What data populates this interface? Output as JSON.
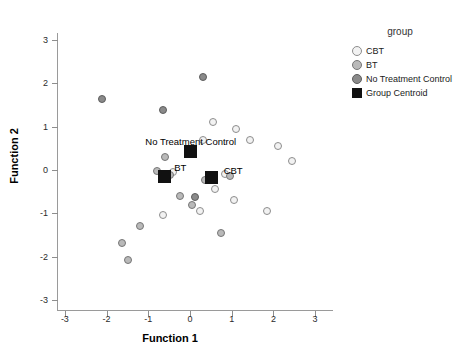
{
  "chart_data": {
    "type": "scatter",
    "title": "",
    "xlabel": "Function 1",
    "ylabel": "Function 2",
    "xlim": [
      -3.4,
      3.4
    ],
    "ylim": [
      -3.4,
      3.4
    ],
    "xticks": [
      "-3",
      "-2",
      "-1",
      "0",
      "1",
      "2",
      "3"
    ],
    "xtickvals": [
      -3,
      -2,
      -1,
      0,
      1,
      2,
      3
    ],
    "yticks": [
      "3",
      "2",
      "1",
      "0",
      "-1",
      "-2",
      "-3"
    ],
    "ytickvals": [
      3,
      2,
      1,
      0,
      -1,
      -2,
      -3
    ],
    "grid": false,
    "legend_position": "right",
    "legend_title": "group",
    "series": [
      {
        "name": "CBT",
        "marker": "circle",
        "color": "#f2f2f2",
        "points": [
          [
            0.55,
            1.1
          ],
          [
            1.1,
            0.95
          ],
          [
            0.3,
            0.7
          ],
          [
            1.45,
            0.7
          ],
          [
            0.85,
            -0.1
          ],
          [
            0.6,
            -0.45
          ],
          [
            1.05,
            -0.7
          ],
          [
            0.25,
            -0.95
          ],
          [
            1.85,
            -0.95
          ],
          [
            -0.4,
            -0.05
          ],
          [
            2.1,
            0.55
          ],
          [
            2.45,
            0.2
          ],
          [
            -0.65,
            -1.05
          ]
        ]
      },
      {
        "name": "BT",
        "marker": "circle",
        "color": "#b9b9b9",
        "points": [
          [
            -0.6,
            0.3
          ],
          [
            -0.48,
            -0.12
          ],
          [
            -0.8,
            -0.02
          ],
          [
            -0.25,
            -0.6
          ],
          [
            0.05,
            -0.8
          ],
          [
            0.35,
            -0.22
          ],
          [
            0.95,
            -0.15
          ],
          [
            0.75,
            -1.45
          ],
          [
            -1.2,
            -1.3
          ],
          [
            -1.62,
            -1.68
          ],
          [
            -1.48,
            -2.08
          ]
        ]
      },
      {
        "name": "No Treatment Control",
        "marker": "circle",
        "color": "#8a8a8a",
        "points": [
          [
            0.32,
            2.15
          ],
          [
            -2.1,
            1.65
          ],
          [
            -0.65,
            1.38
          ],
          [
            -0.05,
            0.38
          ],
          [
            0.12,
            -0.62
          ]
        ]
      }
    ],
    "centroids": [
      {
        "label": "No Treatment Control",
        "x": 0.02,
        "y": 0.42,
        "label_dx": 0,
        "label_dy": -16,
        "label_anchor": "center"
      },
      {
        "label": "BT",
        "x": -0.62,
        "y": -0.14,
        "label_dx": 10,
        "label_dy": -14,
        "label_anchor": "left"
      },
      {
        "label": "CBT",
        "x": 0.52,
        "y": -0.18,
        "label_dx": 12,
        "label_dy": -13,
        "label_anchor": "left"
      }
    ],
    "centroid_color": "#111111"
  },
  "legend": {
    "title": "group",
    "items": [
      {
        "label": "CBT",
        "shape": "circle",
        "color": "#f2f2f2"
      },
      {
        "label": "BT",
        "shape": "circle",
        "color": "#b9b9b9"
      },
      {
        "label": "No Treatment Control",
        "shape": "circle",
        "color": "#8a8a8a"
      },
      {
        "label": "Group Centroid",
        "shape": "square",
        "color": "#111111"
      }
    ]
  }
}
